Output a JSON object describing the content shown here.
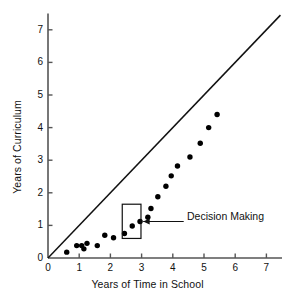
{
  "chart_data": {
    "type": "scatter",
    "title": "",
    "xlabel": "Years of Time in School",
    "ylabel": "Years of Curriculum",
    "xlim": [
      0,
      7.5
    ],
    "ylim": [
      0,
      7.5
    ],
    "grid": false,
    "legend": null,
    "xticks": [
      0,
      1,
      2,
      3,
      4,
      5,
      6,
      7
    ],
    "yticks": [
      0,
      1,
      2,
      3,
      4,
      5,
      6,
      7
    ],
    "xticklabels": [
      "0",
      "1",
      "2",
      "3",
      "4",
      "5",
      "6",
      "7"
    ],
    "yticklabels": [
      "0",
      "1",
      "2",
      "3",
      "4",
      "5",
      "6",
      "7"
    ],
    "points": [
      {
        "x": 0.6,
        "y": 0.18
      },
      {
        "x": 0.92,
        "y": 0.38
      },
      {
        "x": 1.08,
        "y": 0.38
      },
      {
        "x": 1.15,
        "y": 0.28
      },
      {
        "x": 1.25,
        "y": 0.45
      },
      {
        "x": 1.58,
        "y": 0.38
      },
      {
        "x": 1.82,
        "y": 0.7
      },
      {
        "x": 2.1,
        "y": 0.62
      },
      {
        "x": 2.45,
        "y": 0.75
      },
      {
        "x": 2.7,
        "y": 0.98
      },
      {
        "x": 2.95,
        "y": 1.12
      },
      {
        "x": 3.2,
        "y": 1.25
      },
      {
        "x": 3.3,
        "y": 1.52
      },
      {
        "x": 3.52,
        "y": 1.88
      },
      {
        "x": 3.78,
        "y": 2.2
      },
      {
        "x": 3.95,
        "y": 2.52
      },
      {
        "x": 4.15,
        "y": 2.82
      },
      {
        "x": 4.55,
        "y": 3.1
      },
      {
        "x": 4.88,
        "y": 3.52
      },
      {
        "x": 5.15,
        "y": 4.0
      },
      {
        "x": 5.42,
        "y": 4.4
      }
    ],
    "reference_line": {
      "label": "identity line y = x",
      "from": {
        "x": 0,
        "y": 0
      },
      "to": {
        "x": 7.45,
        "y": 7.45
      }
    },
    "annotations": [
      {
        "text": "Decision Making",
        "box": {
          "x0": 2.38,
          "y0": 0.6,
          "x1": 2.98,
          "y1": 1.65
        },
        "arrow_from": {
          "x": 4.35,
          "y": 1.12
        },
        "arrow_to": {
          "x": 3.05,
          "y": 1.12
        }
      }
    ]
  },
  "axes": {
    "x_title": "Years of Time in School",
    "y_title": "Years of Curriculum"
  },
  "colors": {
    "marker": "#000000",
    "axis": "#555555",
    "line": "#111111",
    "text": "#111111",
    "background": "#ffffff"
  }
}
